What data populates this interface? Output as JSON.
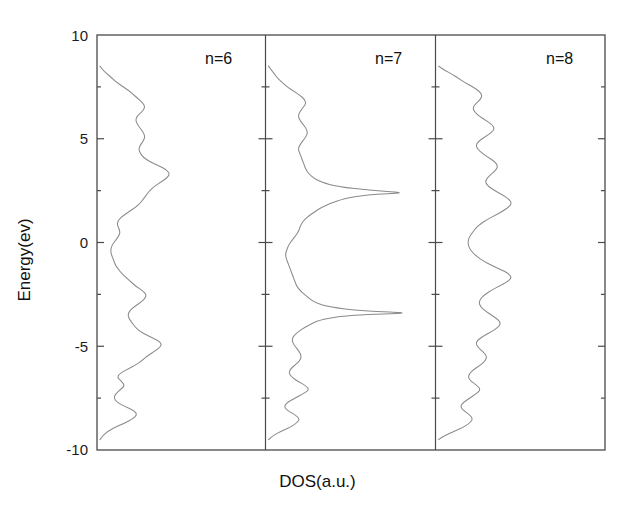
{
  "chart_data": {
    "type": "line",
    "title": "",
    "subtitle": "",
    "xlabel": "DOS(a.u.)",
    "ylabel": "Energy(ev)",
    "orientation": "horizontal-density",
    "grid": false,
    "legend": "none",
    "ylim": [
      -10,
      10
    ],
    "y_major_ticks": [
      10,
      5,
      0,
      -5,
      -10
    ],
    "y_major_tick_labels": [
      "10",
      "5",
      "0",
      "-5",
      "-10"
    ],
    "y_minor_ticks": [
      7.5,
      2.5,
      -2.5,
      -7.5
    ],
    "xlim": [
      0,
      1
    ],
    "x_ticks_shown": false,
    "panel_count": 3,
    "panels": [
      {
        "name": "n=6",
        "label": "n=6",
        "comment": "DOS vs Energy; x = DOS (a.u.) normalized 0-1, y = Energy (eV)",
        "energy": [
          -9.5,
          -9.3,
          -9.1,
          -8.9,
          -8.7,
          -8.5,
          -8.3,
          -8.1,
          -7.9,
          -7.7,
          -7.5,
          -7.3,
          -7.1,
          -6.9,
          -6.7,
          -6.5,
          -6.3,
          -6.1,
          -5.9,
          -5.7,
          -5.5,
          -5.3,
          -5.1,
          -4.9,
          -4.7,
          -4.5,
          -4.3,
          -4.1,
          -3.9,
          -3.7,
          -3.5,
          -3.3,
          -3.1,
          -2.9,
          -2.7,
          -2.5,
          -2.3,
          -2.1,
          -1.9,
          -1.7,
          -1.5,
          -1.3,
          -1.1,
          -0.9,
          -0.7,
          -0.5,
          -0.3,
          -0.1,
          0.1,
          0.3,
          0.5,
          0.7,
          0.9,
          1.1,
          1.3,
          1.5,
          1.7,
          1.9,
          2.1,
          2.3,
          2.5,
          2.7,
          2.9,
          3.1,
          3.3,
          3.5,
          3.7,
          3.9,
          4.1,
          4.3,
          4.5,
          4.7,
          4.9,
          5.1,
          5.3,
          5.5,
          5.7,
          5.9,
          6.1,
          6.3,
          6.5,
          6.7,
          6.9,
          7.1,
          7.3,
          7.5,
          7.7,
          7.9,
          8.1,
          8.3,
          8.5
        ],
        "dos": [
          0.0,
          0.02,
          0.05,
          0.1,
          0.16,
          0.21,
          0.24,
          0.22,
          0.16,
          0.11,
          0.09,
          0.1,
          0.13,
          0.16,
          0.14,
          0.11,
          0.13,
          0.18,
          0.23,
          0.27,
          0.3,
          0.34,
          0.38,
          0.4,
          0.37,
          0.31,
          0.26,
          0.23,
          0.21,
          0.19,
          0.18,
          0.19,
          0.22,
          0.26,
          0.29,
          0.3,
          0.27,
          0.23,
          0.2,
          0.17,
          0.14,
          0.12,
          0.1,
          0.09,
          0.08,
          0.07,
          0.07,
          0.08,
          0.1,
          0.12,
          0.13,
          0.12,
          0.11,
          0.12,
          0.15,
          0.19,
          0.23,
          0.26,
          0.28,
          0.3,
          0.32,
          0.35,
          0.39,
          0.43,
          0.45,
          0.43,
          0.38,
          0.32,
          0.28,
          0.26,
          0.25,
          0.26,
          0.28,
          0.29,
          0.28,
          0.26,
          0.24,
          0.23,
          0.24,
          0.27,
          0.29,
          0.28,
          0.25,
          0.22,
          0.19,
          0.15,
          0.11,
          0.08,
          0.05,
          0.02,
          0.0
        ]
      },
      {
        "name": "n=7",
        "label": "n=7",
        "comment": "DOS vs Energy; sharp peaks near -3.4 eV and +2.4 eV",
        "energy": [
          -9.5,
          -9.3,
          -9.1,
          -8.9,
          -8.7,
          -8.5,
          -8.3,
          -8.1,
          -7.9,
          -7.7,
          -7.5,
          -7.3,
          -7.1,
          -6.9,
          -6.7,
          -6.5,
          -6.3,
          -6.1,
          -5.9,
          -5.7,
          -5.5,
          -5.3,
          -5.1,
          -4.9,
          -4.7,
          -4.5,
          -4.3,
          -4.1,
          -3.9,
          -3.7,
          -3.5,
          -3.4,
          -3.3,
          -3.1,
          -2.9,
          -2.7,
          -2.5,
          -2.3,
          -2.1,
          -1.9,
          -1.7,
          -1.5,
          -1.3,
          -1.1,
          -0.9,
          -0.7,
          -0.5,
          -0.3,
          -0.1,
          0.1,
          0.3,
          0.5,
          0.7,
          0.9,
          1.1,
          1.3,
          1.5,
          1.7,
          1.9,
          2.1,
          2.3,
          2.4,
          2.5,
          2.7,
          2.9,
          3.1,
          3.3,
          3.5,
          3.7,
          3.9,
          4.1,
          4.3,
          4.5,
          4.7,
          4.9,
          5.1,
          5.3,
          5.5,
          5.7,
          5.9,
          6.1,
          6.3,
          6.5,
          6.7,
          6.9,
          7.1,
          7.3,
          7.5,
          7.7,
          7.9,
          8.1,
          8.3,
          8.5
        ],
        "dos": [
          0.0,
          0.03,
          0.08,
          0.14,
          0.18,
          0.2,
          0.17,
          0.12,
          0.1,
          0.12,
          0.17,
          0.22,
          0.26,
          0.24,
          0.19,
          0.15,
          0.13,
          0.14,
          0.17,
          0.2,
          0.21,
          0.2,
          0.18,
          0.16,
          0.15,
          0.16,
          0.19,
          0.23,
          0.28,
          0.34,
          0.52,
          0.95,
          0.6,
          0.38,
          0.3,
          0.26,
          0.23,
          0.2,
          0.18,
          0.17,
          0.16,
          0.15,
          0.14,
          0.13,
          0.12,
          0.11,
          0.11,
          0.12,
          0.13,
          0.15,
          0.17,
          0.19,
          0.2,
          0.21,
          0.23,
          0.26,
          0.3,
          0.34,
          0.4,
          0.48,
          0.62,
          0.9,
          0.66,
          0.44,
          0.34,
          0.29,
          0.26,
          0.24,
          0.23,
          0.22,
          0.21,
          0.2,
          0.19,
          0.2,
          0.22,
          0.24,
          0.25,
          0.24,
          0.22,
          0.2,
          0.19,
          0.2,
          0.22,
          0.24,
          0.23,
          0.2,
          0.16,
          0.12,
          0.09,
          0.06,
          0.04,
          0.02,
          0.0
        ]
      },
      {
        "name": "n=8",
        "label": "n=8",
        "comment": "DOS vs Energy; broad multi-peak structure",
        "energy": [
          -9.5,
          -9.3,
          -9.1,
          -8.9,
          -8.7,
          -8.5,
          -8.3,
          -8.1,
          -7.9,
          -7.7,
          -7.5,
          -7.3,
          -7.1,
          -6.9,
          -6.7,
          -6.5,
          -6.3,
          -6.1,
          -5.9,
          -5.7,
          -5.5,
          -5.3,
          -5.1,
          -4.9,
          -4.7,
          -4.5,
          -4.3,
          -4.1,
          -3.9,
          -3.7,
          -3.5,
          -3.3,
          -3.1,
          -2.9,
          -2.7,
          -2.5,
          -2.3,
          -2.1,
          -1.9,
          -1.7,
          -1.5,
          -1.3,
          -1.1,
          -0.9,
          -0.7,
          -0.5,
          -0.3,
          -0.1,
          0.1,
          0.3,
          0.5,
          0.7,
          0.9,
          1.1,
          1.3,
          1.5,
          1.7,
          1.9,
          2.1,
          2.3,
          2.5,
          2.7,
          2.9,
          3.1,
          3.3,
          3.5,
          3.7,
          3.9,
          4.1,
          4.3,
          4.5,
          4.7,
          4.9,
          5.1,
          5.3,
          5.5,
          5.7,
          5.9,
          6.1,
          6.3,
          6.5,
          6.7,
          6.9,
          7.1,
          7.3,
          7.5,
          7.7,
          7.9,
          8.1,
          8.3,
          8.5
        ],
        "dos": [
          0.0,
          0.04,
          0.1,
          0.16,
          0.2,
          0.22,
          0.2,
          0.16,
          0.14,
          0.16,
          0.2,
          0.24,
          0.27,
          0.25,
          0.21,
          0.19,
          0.2,
          0.23,
          0.27,
          0.3,
          0.31,
          0.29,
          0.26,
          0.24,
          0.25,
          0.29,
          0.34,
          0.38,
          0.4,
          0.38,
          0.34,
          0.3,
          0.27,
          0.26,
          0.27,
          0.3,
          0.34,
          0.39,
          0.44,
          0.47,
          0.45,
          0.4,
          0.34,
          0.29,
          0.25,
          0.22,
          0.2,
          0.19,
          0.19,
          0.2,
          0.22,
          0.24,
          0.27,
          0.31,
          0.36,
          0.41,
          0.45,
          0.47,
          0.45,
          0.41,
          0.36,
          0.32,
          0.3,
          0.31,
          0.34,
          0.37,
          0.38,
          0.36,
          0.32,
          0.28,
          0.25,
          0.24,
          0.26,
          0.3,
          0.34,
          0.36,
          0.34,
          0.3,
          0.26,
          0.23,
          0.22,
          0.24,
          0.27,
          0.28,
          0.26,
          0.22,
          0.17,
          0.13,
          0.09,
          0.04,
          0.0
        ]
      }
    ]
  },
  "axes": {
    "ylabel": "Energy(ev)",
    "xlabel": "DOS(a.u.)",
    "tick_labels": [
      "10",
      "5",
      "0",
      "-5",
      "-10"
    ]
  },
  "panel_labels": {
    "p1": "n=6",
    "p2": "n=7",
    "p3": "n=8"
  },
  "style": {
    "frame_color": "#4a4a4a",
    "curve_color": "#8a8a8a",
    "text_color": "#111111",
    "background": "#ffffff"
  }
}
